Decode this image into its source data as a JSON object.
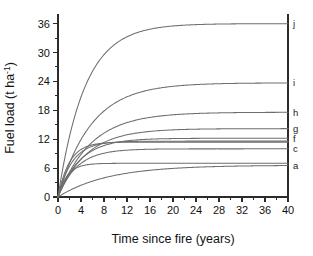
{
  "chart_data": {
    "type": "line",
    "title": "",
    "xlabel": "Time since fire (years)",
    "ylabel": "Fuel load (t ha-1)",
    "ylabel_parts": {
      "main": "Fuel load (t ha",
      "superscript": "-1",
      "tail": ")"
    },
    "xlim": [
      0,
      40
    ],
    "ylim": [
      0,
      38
    ],
    "xticks": [
      0,
      4,
      8,
      12,
      16,
      20,
      24,
      28,
      32,
      36,
      40
    ],
    "yticks": [
      0,
      6,
      12,
      18,
      24,
      30,
      36
    ],
    "xtick_labels": [
      "0",
      "4",
      "8",
      "12",
      "16",
      "20",
      "24",
      "28",
      "32",
      "36",
      "40"
    ],
    "ytick_labels": [
      "0",
      "6",
      "12",
      "18",
      "24",
      "30",
      "36"
    ],
    "x_minor_interval": 2,
    "y_minor_interval": 3,
    "grid": false,
    "legend": "inline-right-edge",
    "model": "y = A * (1 - exp(-k * t))",
    "series": [
      {
        "name": "a",
        "label": "a",
        "asymptote": 6.6,
        "rate": 0.115,
        "label_visible": true,
        "color": "#6e6e6e"
      },
      {
        "name": "b",
        "label": "b",
        "asymptote": 7.0,
        "rate": 0.62,
        "label_visible": false,
        "color": "#6e6e6e"
      },
      {
        "name": "c",
        "label": "c",
        "asymptote": 10.0,
        "rate": 0.3,
        "label_visible": true,
        "color": "#6e6e6e"
      },
      {
        "name": "d",
        "label": "d",
        "asymptote": 11.4,
        "rate": 0.5,
        "label_visible": false,
        "color": "#6e6e6e"
      },
      {
        "name": "e",
        "label": "e",
        "asymptote": 11.6,
        "rate": 0.4,
        "label_visible": false,
        "color": "#6e6e6e"
      },
      {
        "name": "f",
        "label": "f",
        "asymptote": 12.2,
        "rate": 0.26,
        "label_visible": true,
        "color": "#6e6e6e"
      },
      {
        "name": "g",
        "label": "g",
        "asymptote": 14.2,
        "rate": 0.2,
        "label_visible": true,
        "color": "#6e6e6e"
      },
      {
        "name": "h",
        "label": "h",
        "asymptote": 17.6,
        "rate": 0.175,
        "label_visible": true,
        "color": "#6e6e6e"
      },
      {
        "name": "i",
        "label": "i",
        "asymptote": 23.7,
        "rate": 0.175,
        "label_visible": true,
        "color": "#6e6e6e"
      },
      {
        "name": "j",
        "label": "j",
        "asymptote": 36.0,
        "rate": 0.215,
        "label_visible": true,
        "color": "#6e6e6e"
      }
    ],
    "curve_labels": [
      "j",
      "i",
      "h",
      "g",
      "f",
      "c",
      "a"
    ]
  },
  "colors": {
    "background": "#ffffff",
    "axis": "#2b2b2b",
    "curve": "#6e6e6e",
    "text": "#121212"
  }
}
